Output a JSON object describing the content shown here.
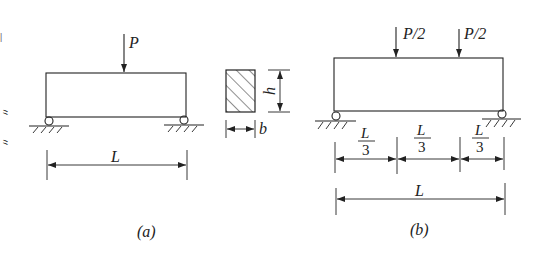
{
  "side_text": "支座",
  "figure_a": {
    "caption": "(a)",
    "load_label": "P",
    "span_label": "L",
    "support_left": "pin-roller",
    "support_right": "roller"
  },
  "cross_section": {
    "height_label": "h",
    "width_label": "b",
    "fill": "hatched"
  },
  "figure_b": {
    "caption": "(b)",
    "load_labels": [
      "P/2",
      "P/2"
    ],
    "segment_numerator": "L",
    "segment_denominator": "3",
    "segments": [
      {
        "num": "L",
        "den": "3"
      },
      {
        "num": "L",
        "den": "3"
      },
      {
        "num": "L",
        "den": "3"
      }
    ],
    "span_label": "L"
  },
  "colors": {
    "line": "#222222",
    "background": "#ffffff"
  }
}
